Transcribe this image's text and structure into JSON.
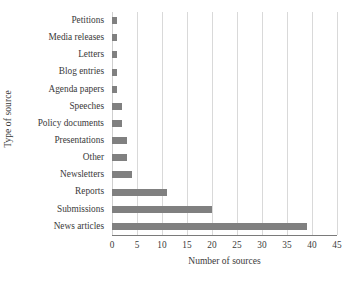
{
  "chart_data": {
    "type": "bar",
    "orientation": "horizontal",
    "title": "",
    "xlabel": "Number of sources",
    "ylabel": "Type of source",
    "xlim": [
      0,
      45
    ],
    "xticks": [
      0,
      5,
      10,
      15,
      20,
      25,
      30,
      35,
      40,
      45
    ],
    "grid": "vertical",
    "legend": "none",
    "bar_color": "#808080",
    "axis_color": "#7a7a7a",
    "gridline_color": "#d9d9d9",
    "text_color": "#3a3a3a",
    "categories": [
      "Petitions",
      "Media releases",
      "Letters",
      "Blog entries",
      "Agenda papers",
      "Speeches",
      "Policy documents",
      "Presentations",
      "Other",
      "Newsletters",
      "Reports",
      "Submissions",
      "News articles"
    ],
    "values": [
      1,
      1,
      1,
      1,
      1,
      2,
      2,
      3,
      3,
      4,
      11,
      20,
      39
    ]
  }
}
